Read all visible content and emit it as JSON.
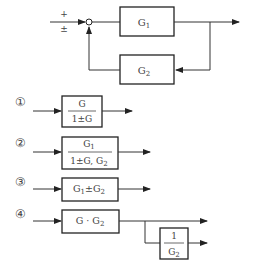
{
  "main_diagram": {
    "summing_junction": {
      "top_sign": "+",
      "bottom_sign": "±"
    },
    "forward_block": {
      "label": "G",
      "subscript": "1"
    },
    "feedback_block": {
      "label": "G",
      "subscript": "2"
    }
  },
  "options": [
    {
      "marker": "①",
      "type": "fraction",
      "numerator": "G",
      "denominator": "1±G"
    },
    {
      "marker": "②",
      "type": "fraction",
      "numerator": "G₁",
      "denominator": "1±G, G₂",
      "numerator_main": "G",
      "numerator_sub": "1",
      "denominator_main": "1±G, G",
      "denominator_sub": "2"
    },
    {
      "marker": "③",
      "type": "text",
      "label_main1": "G",
      "label_sub1": "1",
      "label_op": "±G",
      "label_sub2": "2",
      "label": "G₁±G₂"
    },
    {
      "marker": "④",
      "type": "branch",
      "label_main": "G · G",
      "label_sub": "2",
      "label": "G · G₂",
      "branch_block": {
        "numerator": "1",
        "denominator_main": "G",
        "denominator_sub": "2",
        "denominator": "G₂"
      }
    }
  ]
}
